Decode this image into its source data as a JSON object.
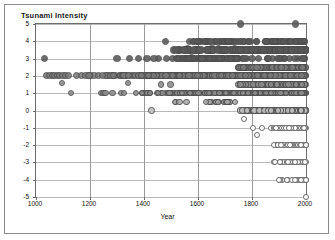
{
  "chart_data": {
    "type": "scatter",
    "title": "Tsunami Intensity",
    "xlabel": "Year",
    "ylabel": "Tsunami Intensity",
    "xlim": [
      1000,
      2000
    ],
    "ylim": [
      -5,
      5
    ],
    "xticks": [
      1000,
      1200,
      1400,
      1600,
      1800,
      2000
    ],
    "yticks": [
      5,
      4,
      3,
      2,
      1,
      0,
      -1,
      -2,
      -3,
      -4,
      -5
    ],
    "ytick_labels": [
      "5",
      "4",
      "3",
      "2",
      "1",
      "0",
      "-1",
      "-2",
      "-3",
      "-4",
      "-5"
    ],
    "xtick_labels": [
      "1000",
      "1200",
      "1400",
      "1600",
      "1800",
      "2000"
    ],
    "grid": {
      "horizontal": true,
      "vertical": true
    },
    "legend": null,
    "marker": "circle",
    "color_scheme": {
      "high_intensity": "#595959",
      "mid_intensity": "#8c8c8c",
      "low_intensity": "#bfbfbf",
      "negative_intensity": "#ffffff",
      "marker_edge": "#4d4d4d",
      "gridline": "#b9b9b9",
      "axis": "#6d6d6d",
      "text": "#111111",
      "background": "#ffffff",
      "frame": "#8a8a8a"
    },
    "points": [
      [
        1030,
        3
      ],
      [
        1040,
        2
      ],
      [
        1052,
        2
      ],
      [
        1060,
        2
      ],
      [
        1070,
        2
      ],
      [
        1080,
        2
      ],
      [
        1088,
        2
      ],
      [
        1096,
        1.6
      ],
      [
        1100,
        2
      ],
      [
        1110,
        2
      ],
      [
        1120,
        2
      ],
      [
        1130,
        1
      ],
      [
        1150,
        2
      ],
      [
        1170,
        2
      ],
      [
        1185,
        2
      ],
      [
        1200,
        2
      ],
      [
        1215,
        2
      ],
      [
        1230,
        2
      ],
      [
        1240,
        1
      ],
      [
        1250,
        1
      ],
      [
        1258,
        1
      ],
      [
        1262,
        2
      ],
      [
        1270,
        2
      ],
      [
        1285,
        2
      ],
      [
        1293,
        2
      ],
      [
        1300,
        3
      ],
      [
        1310,
        2
      ],
      [
        1320,
        2
      ],
      [
        1330,
        2
      ],
      [
        1340,
        1.6
      ],
      [
        1345,
        3
      ],
      [
        1352,
        2
      ],
      [
        1360,
        2
      ],
      [
        1370,
        2
      ],
      [
        1380,
        2
      ],
      [
        1390,
        2
      ],
      [
        1400,
        1
      ],
      [
        1408,
        1
      ],
      [
        1415,
        1
      ],
      [
        1422,
        1
      ],
      [
        1428,
        0
      ],
      [
        1432,
        2
      ],
      [
        1440,
        2
      ],
      [
        1450,
        2
      ],
      [
        1455,
        2
      ],
      [
        1460,
        2
      ],
      [
        1468,
        2
      ],
      [
        1475,
        2
      ],
      [
        1480,
        4
      ],
      [
        1488,
        2
      ],
      [
        1492,
        2
      ],
      [
        1498,
        1.5
      ],
      [
        1500,
        2
      ],
      [
        1505,
        3
      ],
      [
        1510,
        2
      ],
      [
        1515,
        1
      ],
      [
        1520,
        2
      ],
      [
        1525,
        2
      ],
      [
        1530,
        2
      ],
      [
        1535,
        3
      ],
      [
        1540,
        2
      ],
      [
        1545,
        1
      ],
      [
        1550,
        3.5
      ],
      [
        1555,
        2
      ],
      [
        1560,
        3.6
      ],
      [
        1565,
        2
      ],
      [
        1570,
        4
      ],
      [
        1575,
        3.4
      ],
      [
        1578,
        2
      ],
      [
        1582,
        1
      ],
      [
        1586,
        2
      ],
      [
        1590,
        3.5
      ],
      [
        1595,
        2
      ],
      [
        1598,
        1
      ],
      [
        1600,
        4
      ],
      [
        1605,
        3
      ],
      [
        1610,
        2
      ],
      [
        1612,
        1
      ],
      [
        1616,
        2
      ],
      [
        1620,
        3
      ],
      [
        1625,
        2
      ],
      [
        1628,
        1
      ],
      [
        1630,
        4
      ],
      [
        1635,
        3
      ],
      [
        1640,
        2
      ],
      [
        1645,
        1
      ],
      [
        1648,
        2
      ],
      [
        1652,
        3.6
      ],
      [
        1656,
        2
      ],
      [
        1660,
        4
      ],
      [
        1664,
        3
      ],
      [
        1668,
        2
      ],
      [
        1672,
        1
      ],
      [
        1676,
        3.6
      ],
      [
        1680,
        4
      ],
      [
        1684,
        2
      ],
      [
        1688,
        3
      ],
      [
        1692,
        2
      ],
      [
        1696,
        1
      ],
      [
        1700,
        4
      ],
      [
        1704,
        3.5
      ],
      [
        1708,
        2
      ],
      [
        1712,
        1
      ],
      [
        1716,
        0.5
      ],
      [
        1720,
        3
      ],
      [
        1724,
        4
      ],
      [
        1728,
        2
      ],
      [
        1732,
        1
      ],
      [
        1736,
        3.6
      ],
      [
        1740,
        2
      ],
      [
        1744,
        3
      ],
      [
        1748,
        1
      ],
      [
        1752,
        2
      ],
      [
        1756,
        5
      ],
      [
        1760,
        4
      ],
      [
        1764,
        3
      ],
      [
        1768,
        2
      ],
      [
        1772,
        -0.5
      ],
      [
        1776,
        1
      ],
      [
        1780,
        3
      ],
      [
        1784,
        2
      ],
      [
        1788,
        4
      ],
      [
        1792,
        1
      ],
      [
        1796,
        2
      ],
      [
        1800,
        3
      ],
      [
        1804,
        -1
      ],
      [
        1808,
        2
      ],
      [
        1812,
        1
      ],
      [
        1816,
        4
      ],
      [
        1820,
        -1.4
      ],
      [
        1824,
        3
      ],
      [
        1828,
        2
      ],
      [
        1832,
        1
      ],
      [
        1836,
        -1
      ],
      [
        1840,
        3.5
      ],
      [
        1844,
        2
      ],
      [
        1848,
        1
      ],
      [
        1852,
        4
      ],
      [
        1856,
        3
      ],
      [
        1860,
        2
      ],
      [
        1864,
        1
      ],
      [
        1868,
        0
      ],
      [
        1872,
        -1
      ],
      [
        1876,
        3
      ],
      [
        1880,
        2
      ],
      [
        1884,
        1
      ],
      [
        1888,
        -2
      ],
      [
        1892,
        4
      ],
      [
        1896,
        3
      ],
      [
        1900,
        2
      ],
      [
        1904,
        1
      ],
      [
        1908,
        0
      ],
      [
        1912,
        -1
      ],
      [
        1916,
        -2
      ],
      [
        1920,
        3
      ],
      [
        1924,
        2
      ],
      [
        1928,
        1
      ],
      [
        1932,
        -3
      ],
      [
        1936,
        4
      ],
      [
        1940,
        3
      ],
      [
        1944,
        2
      ],
      [
        1948,
        1
      ],
      [
        1952,
        0
      ],
      [
        1956,
        -1
      ],
      [
        1960,
        -2
      ],
      [
        1964,
        4
      ],
      [
        1968,
        3
      ],
      [
        1972,
        2
      ],
      [
        1976,
        1
      ],
      [
        1980,
        0
      ],
      [
        1984,
        -1
      ],
      [
        1988,
        -2
      ],
      [
        1990,
        -3
      ],
      [
        1992,
        4
      ],
      [
        1994,
        3
      ],
      [
        1996,
        2
      ],
      [
        1998,
        1
      ],
      [
        1999,
        0
      ],
      [
        2000,
        -1
      ],
      [
        2000,
        -2
      ],
      [
        2000,
        -3
      ],
      [
        2000,
        -4
      ],
      [
        2000,
        -5
      ],
      [
        1985,
        -4
      ],
      [
        1970,
        -4
      ],
      [
        1955,
        -3
      ],
      [
        1940,
        -2
      ],
      [
        1925,
        -1
      ],
      [
        1910,
        3
      ],
      [
        1895,
        2
      ],
      [
        1880,
        -1
      ],
      [
        1960,
        5
      ],
      [
        1975,
        4
      ],
      [
        1985,
        3
      ],
      [
        1995,
        4
      ],
      [
        1930,
        -4
      ],
      [
        1945,
        -3
      ],
      [
        1915,
        -2
      ]
    ]
  }
}
